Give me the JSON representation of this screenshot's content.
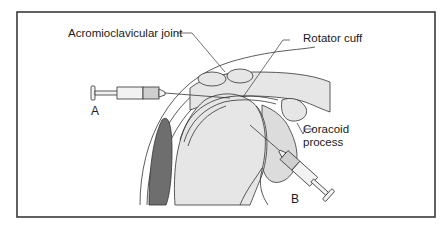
{
  "figure": {
    "type": "anatomical illustration",
    "labels": {
      "acromioclavicular_joint": "Acromioclavicular joint",
      "rotator_cuff": "Rotator cuff",
      "coracoid_line1": "Coracoid",
      "coracoid_line2": "process"
    },
    "needle_markers": {
      "a": "A",
      "b": "B"
    },
    "colors": {
      "frame": "#3a3a3a",
      "line": "#333333",
      "bone_fill": "#e6e6e6",
      "dark_region": "#6e6e6e",
      "syringe_fluid": "#cfcfcf",
      "background": "#ffffff"
    }
  }
}
